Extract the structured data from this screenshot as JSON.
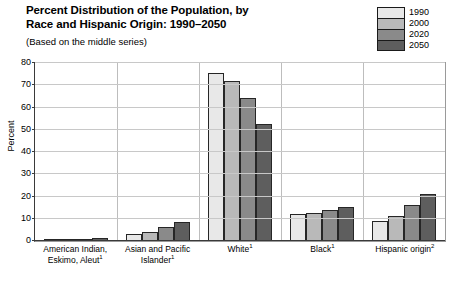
{
  "header": {
    "title_line1": "Percent Distribution of the Population, by",
    "title_line2": "Race and Hispanic Origin: 1990–2050",
    "subtitle": "(Based on the middle series)"
  },
  "chart_data": {
    "type": "bar",
    "title": "Percent Distribution of the Population, by Race and Hispanic Origin: 1990–2050",
    "subtitle": "(Based on the middle series)",
    "xlabel": "",
    "ylabel": "Percent",
    "ylim": [
      0,
      80
    ],
    "yticks": [
      0,
      10,
      20,
      30,
      40,
      50,
      60,
      70,
      80
    ],
    "grid": true,
    "legend_position": "top-right",
    "categories": [
      "American Indian, Eskimo, Aleut",
      "Asian and Pacific Islander",
      "White",
      "Black",
      "Hispanic origin"
    ],
    "category_footnotes": [
      "1",
      "1",
      "1",
      "1",
      "2"
    ],
    "category_lines": [
      [
        "American Indian,",
        "Eskimo, Aleut"
      ],
      [
        "Asian and Pacific",
        "Islander"
      ],
      [
        "White"
      ],
      [
        "Black"
      ],
      [
        "Hispanic origin"
      ]
    ],
    "series": [
      {
        "name": "1990",
        "color": "#e8e8e8",
        "values": [
          0.8,
          3.0,
          75.7,
          12.3,
          9.0
        ]
      },
      {
        "name": "2000",
        "color": "#b9b9b9",
        "values": [
          0.9,
          4.1,
          71.8,
          12.8,
          11.4
        ]
      },
      {
        "name": "2020",
        "color": "#8a8a8a",
        "values": [
          1.0,
          6.2,
          64.3,
          13.9,
          16.3
        ]
      },
      {
        "name": "2050",
        "color": "#5e5e5e",
        "values": [
          1.2,
          8.7,
          52.8,
          15.4,
          21.1
        ]
      }
    ]
  }
}
